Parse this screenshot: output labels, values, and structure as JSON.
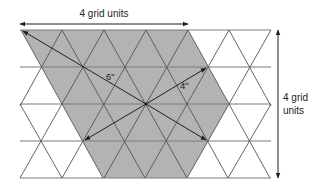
{
  "diagram": {
    "type": "triangular-grid-area",
    "colors": {
      "shade": "#b3b3b3",
      "line": "#4d4d4d",
      "grid_line": "#6d6d6d",
      "text": "#231f20",
      "background": "#ffffff"
    },
    "grid": {
      "rows_y": [
        30,
        67,
        104,
        141,
        178
      ],
      "x_left": 20,
      "x_right": 271,
      "cell_width": 41.7
    },
    "shaded_region": {
      "points": [
        [
          21,
          30
        ],
        [
          188,
          30
        ],
        [
          229,
          104
        ],
        [
          187,
          178
        ],
        [
          103,
          178
        ]
      ]
    },
    "center_point": [
      146,
      104
    ],
    "arrows": [
      {
        "name": "radius-6",
        "to": [
          21,
          30
        ],
        "label": "6\""
      },
      {
        "name": "radius-4",
        "to": [
          208,
          67
        ],
        "label": "4\""
      },
      {
        "name": "radius-bottom-left",
        "to": [
          83,
          141
        ]
      },
      {
        "name": "radius-bottom-right",
        "to": [
          208,
          141
        ]
      }
    ],
    "dimensions": {
      "top": {
        "label": "4 grid units"
      },
      "right": {
        "label_line1": "4 grid",
        "label_line2": "units"
      }
    }
  }
}
